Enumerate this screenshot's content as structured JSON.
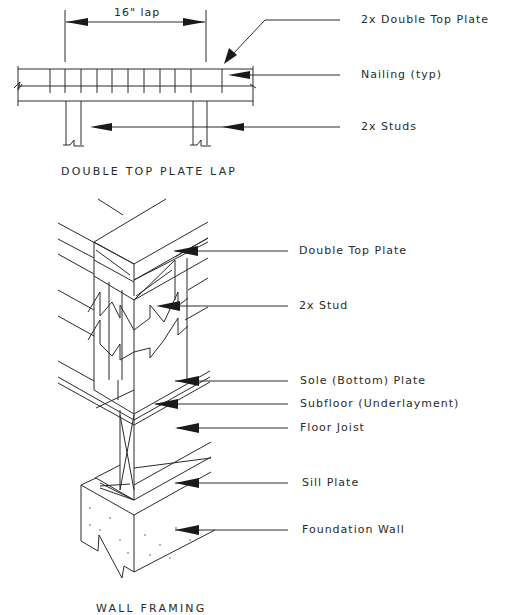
{
  "figures": [
    {
      "id": "double-top-plate-lap",
      "caption": "DOUBLE TOP PLATE LAP",
      "dimension": "16\"  lap",
      "callouts": [
        {
          "label": "2x Double Top Plate"
        },
        {
          "label": "Nailing (typ)"
        },
        {
          "label": "2x Studs"
        }
      ]
    },
    {
      "id": "wall-framing",
      "caption": "WALL FRAMING",
      "callouts": [
        {
          "label": "Double Top Plate"
        },
        {
          "label": "2x Stud"
        },
        {
          "label": "Sole (Bottom) Plate"
        },
        {
          "label": "Subfloor (Underlayment)"
        },
        {
          "label": "Floor Joist"
        },
        {
          "label": "Sill Plate"
        },
        {
          "label": "Foundation Wall"
        }
      ]
    }
  ],
  "colors": {
    "line": "#2a2a2a",
    "background": "#ffffff"
  }
}
